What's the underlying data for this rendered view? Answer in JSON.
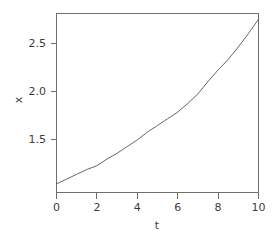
{
  "chart_data": {
    "type": "line",
    "title": "",
    "subtitle": "",
    "xlabel": "t",
    "ylabel": "x",
    "xlim": [
      0,
      10
    ],
    "ylim": [
      0.94,
      2.81
    ],
    "grid": false,
    "legend": null,
    "xticks": [
      0,
      2,
      4,
      6,
      8,
      10
    ],
    "xticklabels": [
      "0",
      "2",
      "4",
      "6",
      "8",
      "10"
    ],
    "yticks": [
      1.5,
      2.0,
      2.5
    ],
    "yticklabels": [
      "1.5",
      "2.0",
      "2.5"
    ],
    "line_color": "#555555",
    "frame_color": "#6e6e6e",
    "series": [
      {
        "name": "x(t)",
        "x": [
          0,
          0.5,
          1,
          1.5,
          2,
          2.5,
          3,
          3.5,
          4,
          4.5,
          5,
          5.5,
          6,
          6.5,
          7,
          7.5,
          8,
          8.5,
          9,
          9.5,
          10
        ],
        "values": [
          1.03,
          1.08,
          1.13,
          1.18,
          1.22,
          1.29,
          1.35,
          1.42,
          1.49,
          1.57,
          1.64,
          1.71,
          1.78,
          1.87,
          1.97,
          2.1,
          2.22,
          2.33,
          2.46,
          2.6,
          2.75
        ]
      }
    ]
  },
  "axis": {
    "x_label": "t",
    "y_label": "x"
  }
}
